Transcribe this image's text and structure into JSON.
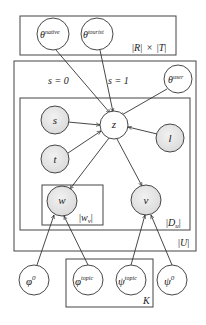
{
  "plates": {
    "region_time": {
      "label_R": "|R|",
      "label_times": "×",
      "label_T": "|T|"
    },
    "users": {
      "label": "|U|"
    },
    "documents": {
      "label_D": "|D",
      "label_sub": "u",
      "label_close": "|"
    },
    "words": {
      "label_W": "|w",
      "label_sub": "v",
      "label_close": "|"
    },
    "topics": {
      "label": "K"
    }
  },
  "edge_labels": {
    "s0": "s = 0",
    "s1": "s = 1"
  },
  "nodes": {
    "theta_native": {
      "base": "θ",
      "sup": "native",
      "observed": false
    },
    "theta_tourist": {
      "base": "θ",
      "sup": "tourist",
      "observed": false
    },
    "theta_user": {
      "base": "θ",
      "sup": "user",
      "observed": false
    },
    "s": {
      "base": "s",
      "observed": true
    },
    "z": {
      "base": "z",
      "observed": false
    },
    "l": {
      "base": "l",
      "observed": true
    },
    "t": {
      "base": "t",
      "observed": true
    },
    "w": {
      "base": "w",
      "observed": true
    },
    "v": {
      "base": "v",
      "observed": true
    },
    "phi0": {
      "base": "φ",
      "sup": "0",
      "observed": false
    },
    "phi_topic": {
      "base": "φ",
      "sup": "topic",
      "observed": false
    },
    "psi_topic": {
      "base": "ψ",
      "sup": "topic",
      "observed": false
    },
    "psi0": {
      "base": "ψ",
      "sup": "0",
      "observed": false
    }
  },
  "colors": {
    "observed_fill": "#e6e6e6",
    "latent_fill": "#ffffff",
    "stroke": "#333333"
  }
}
